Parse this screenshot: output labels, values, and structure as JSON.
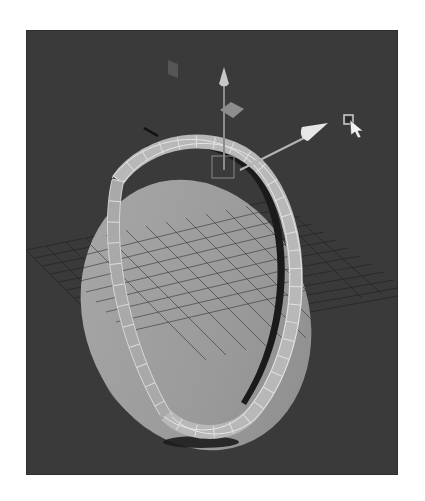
{
  "viewport": {
    "label": "3D perspective viewport",
    "background_color": "#3a3a3a",
    "scene": {
      "objects": [
        {
          "name": "cylinder-disc",
          "type": "polygon cylinder",
          "face_color": "#9a9a9a",
          "side_color": "#8a8a8a"
        },
        {
          "name": "selected-ring",
          "type": "extruded edge ring (selected faces)",
          "color": "#bdbdbd"
        }
      ],
      "grid": {
        "visible": true,
        "line_color": "#1e1e1e"
      }
    },
    "manipulator": {
      "type": "move-tool",
      "axes": [
        "x",
        "y",
        "z"
      ],
      "active_axis": "x",
      "axis_color": "#d8d8d8"
    },
    "cursor": {
      "type": "arrow-with-square",
      "x": 350,
      "y": 122
    }
  }
}
